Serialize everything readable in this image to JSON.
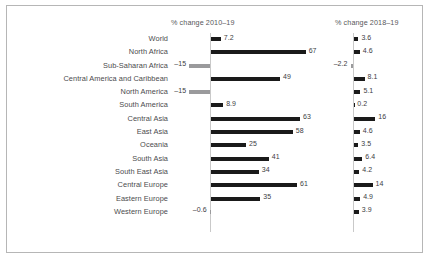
{
  "chart_data": {
    "type": "bar",
    "title": "",
    "subtitle": "",
    "xlabel": "",
    "ylabel": "",
    "grid": false,
    "legend_position": "none",
    "orientation": "horizontal",
    "panels": [
      {
        "name": "left-panel",
        "header": "% change 2010–19",
        "xlim": [
          -20,
          70
        ],
        "values": [
          7.2,
          67,
          -15,
          49,
          -15,
          8.9,
          63,
          58,
          25,
          41,
          34,
          61,
          35,
          -0.6
        ],
        "labels": [
          "7.2",
          "67",
          "–15",
          "49",
          "–15",
          "8.9",
          "63",
          "58",
          "25",
          "41",
          "34",
          "61",
          "35",
          "–0.6"
        ]
      },
      {
        "name": "right-panel",
        "header": "% change 2018–19",
        "xlim": [
          -4,
          18
        ],
        "values": [
          3.6,
          4.6,
          -2.2,
          8.1,
          5.1,
          0.2,
          16,
          4.6,
          3.5,
          6.4,
          4.2,
          14,
          4.9,
          3.9
        ],
        "labels": [
          "3.6",
          "4.6",
          "–2.2",
          "8.1",
          "5.1",
          "0.2",
          "16",
          "4.6",
          "3.5",
          "6.4",
          "4.2",
          "14",
          "4.9",
          "3.9"
        ]
      }
    ],
    "categories": [
      "World",
      "North Africa",
      "Sub-Saharan Africa",
      "Central America and Caribbean",
      "North America",
      "South America",
      "Central Asia",
      "East Asia",
      "Oceania",
      "South Asia",
      "South East Asia",
      "Central Europe",
      "Eastern Europe",
      "Western Europe"
    ],
    "series": [
      {
        "name": "% change 2010–19",
        "values": [
          7.2,
          67,
          -15,
          49,
          -15,
          8.9,
          63,
          58,
          25,
          41,
          34,
          61,
          35,
          -0.6
        ]
      },
      {
        "name": "% change 2018–19",
        "values": [
          3.6,
          4.6,
          -2.2,
          8.1,
          5.1,
          0.2,
          16,
          4.6,
          3.5,
          6.4,
          4.2,
          14,
          4.9,
          3.9
        ]
      }
    ],
    "colors": {
      "positive_bar": "#1a1a1a",
      "negative_bar": "#9a9a9c",
      "axis_line": "#c9c9c9",
      "frame_border": "#b6b6b6",
      "label_text": "#4b4b4d",
      "header_text": "#58585a",
      "background": "#ffffff"
    }
  }
}
